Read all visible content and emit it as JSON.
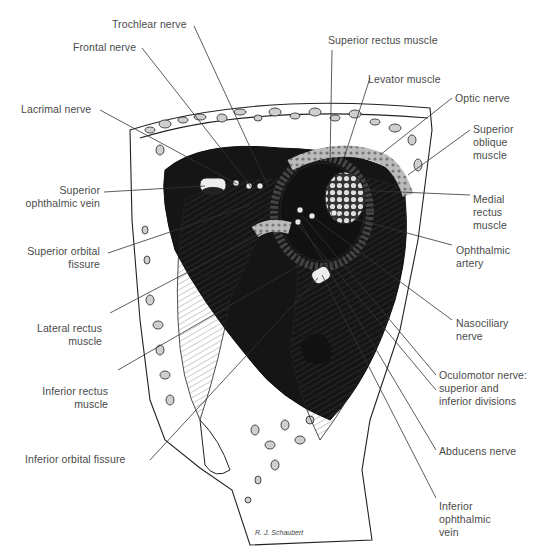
{
  "figure": {
    "signature": "R. J. Schaubert",
    "ink_color": "#1a1a1a",
    "label_color": "#4a4a4a",
    "background": "#ffffff"
  },
  "labels_left": [
    {
      "id": "trochlear",
      "text": "Trochlear nerve"
    },
    {
      "id": "frontal",
      "text": "Frontal nerve"
    },
    {
      "id": "lacrimal",
      "text": "Lacrimal nerve"
    },
    {
      "id": "sup_ophth_vein",
      "text": "Superior\nophthalmic vein"
    },
    {
      "id": "sup_orb_fissure",
      "text": "Superior orbital\nfissure"
    },
    {
      "id": "lat_rectus",
      "text": "Lateral rectus\nmuscle"
    },
    {
      "id": "inf_rectus",
      "text": "Inferior rectus\nmuscle"
    },
    {
      "id": "inf_orb_fissure",
      "text": "Inferior orbital fissure"
    }
  ],
  "labels_right": [
    {
      "id": "sup_rectus",
      "text": "Superior rectus muscle"
    },
    {
      "id": "levator",
      "text": "Levator muscle"
    },
    {
      "id": "optic",
      "text": "Optic nerve"
    },
    {
      "id": "sup_oblique",
      "text": "Superior\noblique\nmuscle"
    },
    {
      "id": "med_rectus",
      "text": "Medial\nrectus\nmuscle"
    },
    {
      "id": "ophth_artery",
      "text": "Ophthalmic\nartery"
    },
    {
      "id": "nasociliary",
      "text": "Nasociliary\nnerve"
    },
    {
      "id": "oculomotor",
      "text": "Oculomotor nerve:\nsuperior and\ninferior divisions"
    },
    {
      "id": "abducens",
      "text": "Abducens nerve"
    },
    {
      "id": "inf_ophth_vein",
      "text": "Inferior\nophthalmic\nvein"
    }
  ]
}
